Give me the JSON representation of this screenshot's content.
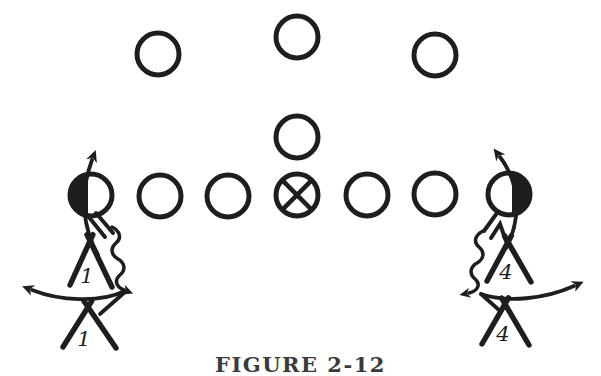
{
  "figure": {
    "caption": "FIGURE 2-12",
    "ink": "#1e1e1e",
    "background": "#ffffff"
  },
  "formation": {
    "circle_radius": 21,
    "players": [
      {
        "id": "back-left",
        "x": 158,
        "y": 54,
        "variant": "open"
      },
      {
        "id": "back-middle",
        "x": 297,
        "y": 37,
        "variant": "open"
      },
      {
        "id": "back-right",
        "x": 435,
        "y": 55,
        "variant": "open"
      },
      {
        "id": "quarterback",
        "x": 297,
        "y": 137,
        "variant": "open"
      },
      {
        "id": "left-end",
        "x": 91,
        "y": 195,
        "variant": "half-left-filled"
      },
      {
        "id": "left-tackle",
        "x": 160,
        "y": 196,
        "variant": "open"
      },
      {
        "id": "left-guard",
        "x": 228,
        "y": 196,
        "variant": "open"
      },
      {
        "id": "center",
        "x": 297,
        "y": 195,
        "variant": "crossed"
      },
      {
        "id": "right-guard",
        "x": 367,
        "y": 195,
        "variant": "open"
      },
      {
        "id": "right-tackle",
        "x": 435,
        "y": 194,
        "variant": "open"
      },
      {
        "id": "right-end",
        "x": 509,
        "y": 194,
        "variant": "half-right-filled"
      }
    ]
  },
  "defenders": [
    {
      "id": "left-front",
      "label": "1",
      "apex": [
        90,
        241
      ],
      "feet": [
        [
          70,
          285
        ],
        [
          112,
          287
        ]
      ],
      "label_pos": [
        87,
        283
      ]
    },
    {
      "id": "left-deep",
      "label": "1",
      "apex": [
        88,
        307
      ],
      "feet": [
        [
          63,
          347
        ],
        [
          116,
          348
        ]
      ],
      "label_pos": [
        84,
        346
      ]
    },
    {
      "id": "right-front",
      "label": "4",
      "apex": [
        508,
        242
      ],
      "feet": [
        [
          487,
          281
        ],
        [
          531,
          282
        ]
      ],
      "label_pos": [
        506,
        279
      ]
    },
    {
      "id": "right-deep",
      "label": "4",
      "apex": [
        505,
        304
      ],
      "feet": [
        [
          482,
          344
        ],
        [
          529,
          345
        ]
      ],
      "label_pos": [
        503,
        341
      ]
    }
  ]
}
